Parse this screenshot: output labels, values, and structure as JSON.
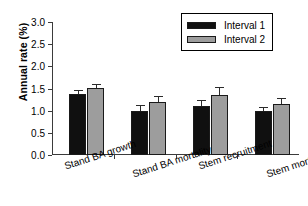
{
  "chart_data": {
    "type": "bar",
    "title": "",
    "xlabel": "",
    "ylabel": "Annual rate (%)",
    "ylim": [
      0.0,
      3.0
    ],
    "ytick_labels": [
      "0.0",
      "0.5",
      "1.0",
      "1.5",
      "2.0",
      "2.5",
      "3.0"
    ],
    "ytick_values": [
      0.0,
      0.5,
      1.0,
      1.5,
      2.0,
      2.5,
      3.0
    ],
    "grid": false,
    "legend_position": "top-right",
    "categories": [
      "Stand BA growth",
      "Stand BA mortality",
      "Stem recruitment",
      "Stem mortality"
    ],
    "series": [
      {
        "name": "Interval 1",
        "color": "#101010",
        "values": [
          1.38,
          1.0,
          1.11,
          1.0
        ],
        "errors": [
          0.09,
          0.13,
          0.13,
          0.09
        ]
      },
      {
        "name": "Interval 2",
        "color": "#9d9d9d",
        "values": [
          1.51,
          1.2,
          1.36,
          1.16
        ],
        "errors": [
          0.1,
          0.12,
          0.17,
          0.12
        ]
      }
    ]
  },
  "legend": {
    "items": [
      {
        "label": "Interval 1"
      },
      {
        "label": "Interval 2"
      }
    ]
  },
  "axes": {
    "y_title": "Annual rate (%)"
  }
}
